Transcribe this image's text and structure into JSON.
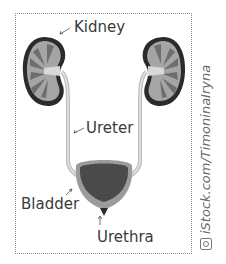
{
  "diagram": {
    "labels": {
      "kidney": "Kidney",
      "ureter": "Ureter",
      "bladder": "Bladder",
      "urethra": "Urethra"
    },
    "credit": "iStock.com/TimoninaIryna",
    "credit_icon": "camera-icon",
    "colors": {
      "kidney_outline": "#2b2b2b",
      "kidney_fill": "#9a9a9a",
      "ureter": "#c8c8c8",
      "bladder_outer": "#9b9b9b",
      "bladder_inner": "#4a4a4a",
      "text": "#3a3a3a",
      "frame": "#8a8a8a"
    }
  }
}
